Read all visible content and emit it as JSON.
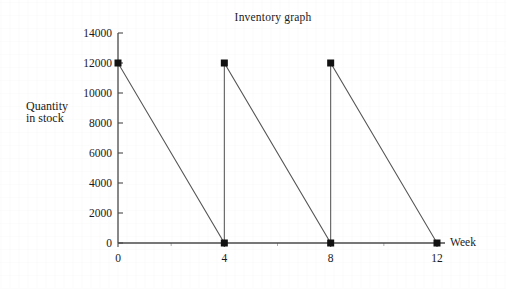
{
  "chart_data": {
    "type": "line",
    "title": "Inventory graph",
    "xlabel": "Week",
    "ylabel_line1": "Quantity",
    "ylabel_line2": "in stock",
    "xlim": [
      0,
      12
    ],
    "ylim": [
      0,
      14000
    ],
    "grid": false,
    "legend": "none",
    "x_ticks": [
      0,
      4,
      8,
      12
    ],
    "x_tick_labels": [
      "0",
      "4",
      "8",
      "12"
    ],
    "x_minor_ticks": [
      2,
      6,
      10
    ],
    "y_ticks": [
      0,
      2000,
      4000,
      6000,
      8000,
      10000,
      12000,
      14000
    ],
    "y_tick_labels": [
      "0",
      "2000",
      "4000",
      "6000",
      "8000",
      "10000",
      "12000",
      "14000"
    ],
    "marker": "filled-square",
    "marker_color": "#111111",
    "line_color": "#555555",
    "series": [
      {
        "name": "Quantity in stock",
        "x": [
          0,
          4,
          4,
          8,
          8,
          12
        ],
        "values": [
          12000,
          0,
          12000,
          0,
          12000,
          0
        ]
      }
    ],
    "markers": [
      {
        "x": 0,
        "y": 12000
      },
      {
        "x": 4,
        "y": 0
      },
      {
        "x": 4,
        "y": 12000
      },
      {
        "x": 8,
        "y": 0
      },
      {
        "x": 8,
        "y": 12000
      },
      {
        "x": 12,
        "y": 0
      }
    ],
    "annotations": []
  }
}
